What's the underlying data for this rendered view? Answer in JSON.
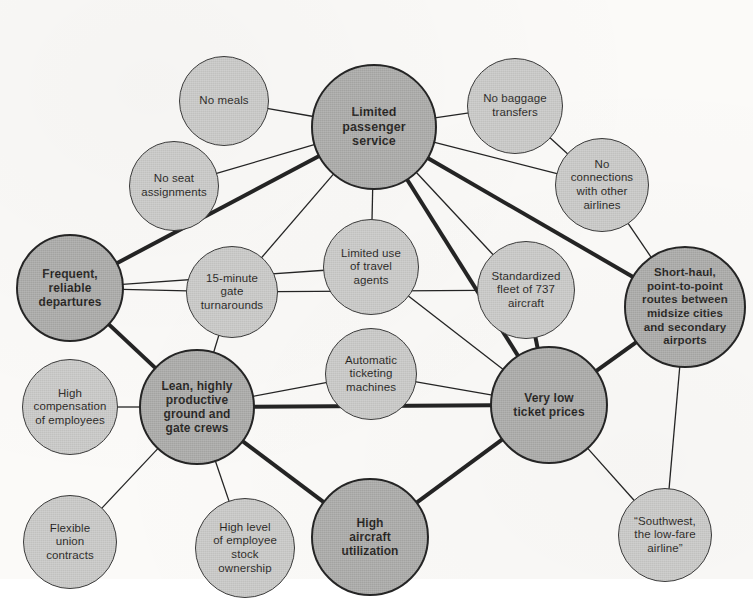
{
  "diagram": {
    "colors": {
      "primary_fill": "#a9a9a7",
      "secondary_fill": "#c8c8c6",
      "primary_stroke": "#252525",
      "secondary_stroke": "#3a3a3a",
      "background": "#fbfaf8",
      "text": "#1d1b19"
    },
    "nodes": [
      {
        "id": "limited-passenger-service",
        "label": "Limited\npassenger\nservice",
        "kind": "primary",
        "cx": 374,
        "cy": 127,
        "r": 63,
        "font": 12.5
      },
      {
        "id": "no-meals",
        "label": "No meals",
        "kind": "secondary",
        "cx": 224,
        "cy": 101,
        "r": 45,
        "font": 11.5
      },
      {
        "id": "no-seat-assignments",
        "label": "No seat\nassignments",
        "kind": "secondary",
        "cx": 174,
        "cy": 186,
        "r": 45,
        "font": 11.5
      },
      {
        "id": "no-baggage-transfers",
        "label": "No baggage\ntransfers",
        "kind": "secondary",
        "cx": 515,
        "cy": 106,
        "r": 48,
        "font": 11.5
      },
      {
        "id": "no-connections-other-airlines",
        "label": "No\nconnections\nwith other\nairlines",
        "kind": "secondary",
        "cx": 602,
        "cy": 185,
        "r": 47,
        "font": 11.5
      },
      {
        "id": "short-haul-point-to-point",
        "label": "Short-haul,\npoint-to-point\nroutes between\nmidsize cities\nand secondary\nairports",
        "kind": "primary",
        "cx": 685,
        "cy": 307,
        "r": 61,
        "font": 11.5
      },
      {
        "id": "limited-use-travel-agents",
        "label": "Limited use\nof travel\nagents",
        "kind": "secondary",
        "cx": 371,
        "cy": 267,
        "r": 48,
        "font": 11.5
      },
      {
        "id": "standardized-fleet-737",
        "label": "Standardized\nfleet of 737\naircraft",
        "kind": "secondary",
        "cx": 526,
        "cy": 290,
        "r": 49,
        "font": 11.5
      },
      {
        "id": "frequent-reliable-departures",
        "label": "Frequent,\nreliable\ndepartures",
        "kind": "primary",
        "cx": 70,
        "cy": 288,
        "r": 54,
        "font": 12
      },
      {
        "id": "fifteen-minute-gate-turnarounds",
        "label": "15-minute\ngate\nturnarounds",
        "kind": "secondary",
        "cx": 232,
        "cy": 292,
        "r": 46,
        "font": 11.5
      },
      {
        "id": "automatic-ticketing-machines",
        "label": "Automatic\nticketing\nmachines",
        "kind": "secondary",
        "cx": 371,
        "cy": 374,
        "r": 46,
        "font": 11.5
      },
      {
        "id": "lean-productive-crews",
        "label": "Lean, highly\nproductive\nground and\ngate crews",
        "kind": "primary",
        "cx": 197,
        "cy": 407,
        "r": 58,
        "font": 12
      },
      {
        "id": "high-compensation-employees",
        "label": "High\ncompensation\nof employees",
        "kind": "secondary",
        "cx": 70,
        "cy": 407,
        "r": 48,
        "font": 11.5
      },
      {
        "id": "very-low-ticket-prices",
        "label": "Very low\nticket prices",
        "kind": "primary",
        "cx": 549,
        "cy": 405,
        "r": 59,
        "font": 12
      },
      {
        "id": "flexible-union-contracts",
        "label": "Flexible\nunion\ncontracts",
        "kind": "secondary",
        "cx": 70,
        "cy": 542,
        "r": 47,
        "font": 11.5
      },
      {
        "id": "high-employee-stock-ownership",
        "label": "High level\nof employee\nstock\nownership",
        "kind": "secondary",
        "cx": 245,
        "cy": 548,
        "r": 50,
        "font": 11.5
      },
      {
        "id": "high-aircraft-utilization",
        "label": "High\naircraft\nutilization",
        "kind": "primary",
        "cx": 370,
        "cy": 537,
        "r": 59,
        "font": 12
      },
      {
        "id": "southwest-low-fare-airline",
        "label": "“Southwest,\nthe low-fare\nairline”",
        "kind": "secondary",
        "cx": 665,
        "cy": 535,
        "r": 47,
        "font": 11.5
      }
    ],
    "edges": [
      {
        "from": "no-meals",
        "to": "limited-passenger-service",
        "weight": "thin"
      },
      {
        "from": "no-seat-assignments",
        "to": "limited-passenger-service",
        "weight": "thin"
      },
      {
        "from": "no-baggage-transfers",
        "to": "limited-passenger-service",
        "weight": "thin"
      },
      {
        "from": "no-connections-other-airlines",
        "to": "limited-passenger-service",
        "weight": "thin"
      },
      {
        "from": "no-baggage-transfers",
        "to": "no-connections-other-airlines",
        "weight": "thin"
      },
      {
        "from": "no-connections-other-airlines",
        "to": "short-haul-point-to-point",
        "weight": "thin"
      },
      {
        "from": "limited-passenger-service",
        "to": "short-haul-point-to-point",
        "weight": "thick"
      },
      {
        "from": "limited-passenger-service",
        "to": "frequent-reliable-departures",
        "weight": "thick"
      },
      {
        "from": "limited-passenger-service",
        "to": "limited-use-travel-agents",
        "weight": "thin"
      },
      {
        "from": "limited-passenger-service",
        "to": "very-low-ticket-prices",
        "weight": "thick"
      },
      {
        "from": "limited-passenger-service",
        "to": "fifteen-minute-gate-turnarounds",
        "weight": "thin"
      },
      {
        "from": "limited-passenger-service",
        "to": "standardized-fleet-737",
        "weight": "thin"
      },
      {
        "from": "limited-use-travel-agents",
        "to": "very-low-ticket-prices",
        "weight": "thin"
      },
      {
        "from": "limited-use-travel-agents",
        "to": "frequent-reliable-departures",
        "weight": "thin"
      },
      {
        "from": "automatic-ticketing-machines",
        "to": "very-low-ticket-prices",
        "weight": "thin"
      },
      {
        "from": "automatic-ticketing-machines",
        "to": "lean-productive-crews",
        "weight": "thin"
      },
      {
        "from": "frequent-reliable-departures",
        "to": "fifteen-minute-gate-turnarounds",
        "weight": "thin"
      },
      {
        "from": "frequent-reliable-departures",
        "to": "lean-productive-crews",
        "weight": "thick"
      },
      {
        "from": "fifteen-minute-gate-turnarounds",
        "to": "lean-productive-crews",
        "weight": "thin"
      },
      {
        "from": "fifteen-minute-gate-turnarounds",
        "to": "standardized-fleet-737",
        "weight": "thin"
      },
      {
        "from": "lean-productive-crews",
        "to": "high-compensation-employees",
        "weight": "thin"
      },
      {
        "from": "lean-productive-crews",
        "to": "flexible-union-contracts",
        "weight": "thin"
      },
      {
        "from": "lean-productive-crews",
        "to": "high-employee-stock-ownership",
        "weight": "thin"
      },
      {
        "from": "lean-productive-crews",
        "to": "high-aircraft-utilization",
        "weight": "thick"
      },
      {
        "from": "lean-productive-crews",
        "to": "very-low-ticket-prices",
        "weight": "thick"
      },
      {
        "from": "high-aircraft-utilization",
        "to": "very-low-ticket-prices",
        "weight": "thick"
      },
      {
        "from": "standardized-fleet-737",
        "to": "very-low-ticket-prices",
        "weight": "thick"
      },
      {
        "from": "short-haul-point-to-point",
        "to": "very-low-ticket-prices",
        "weight": "thick"
      },
      {
        "from": "short-haul-point-to-point",
        "to": "southwest-low-fare-airline",
        "weight": "thin"
      },
      {
        "from": "very-low-ticket-prices",
        "to": "southwest-low-fare-airline",
        "weight": "thin"
      }
    ]
  }
}
